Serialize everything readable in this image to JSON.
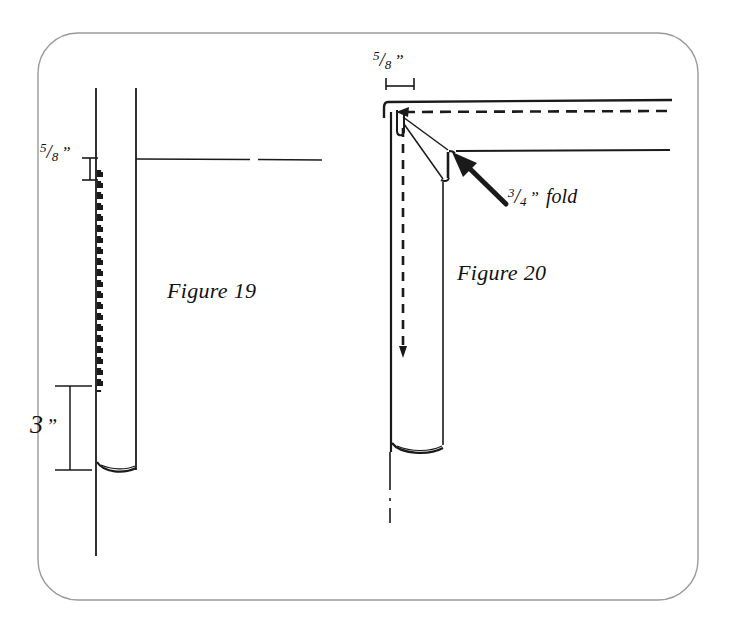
{
  "document": {
    "title": "Pocket Fold Construction Diagrams",
    "background_color": "#ffffff",
    "ink_color": "#111111",
    "frame_color": "#8a8a8a"
  },
  "figures": [
    {
      "id": "figure-19",
      "caption": "Figure 19",
      "dimensions": [
        {
          "id": "fig19-seam-allowance",
          "numerator": "5",
          "slash": "/",
          "denominator": "8",
          "unit": "”",
          "orientation": "vertical",
          "description": "5/8 inch seam allowance at top of stitching line"
        },
        {
          "id": "fig19-length",
          "whole": "3",
          "unit": "”",
          "orientation": "vertical",
          "description": "3 inch measurement at lower portion of tube"
        }
      ]
    },
    {
      "id": "figure-20",
      "caption": "Figure 20",
      "dimensions": [
        {
          "id": "fig20-seam-allowance",
          "numerator": "5",
          "slash": "/",
          "denominator": "8",
          "unit": "”",
          "orientation": "horizontal",
          "description": "5/8 inch seam allowance at top edge"
        }
      ],
      "annotations": [
        {
          "id": "fig20-fold-callout",
          "numerator": "3",
          "slash": "/",
          "denominator": "4",
          "unit": "”",
          "text": "fold",
          "description": "3/4 inch fold callout with arrow pointing to folded notch"
        }
      ]
    }
  ],
  "icons": {
    "arrow_pointer": "arrow-icon",
    "dimension_tick": "tick-icon"
  }
}
